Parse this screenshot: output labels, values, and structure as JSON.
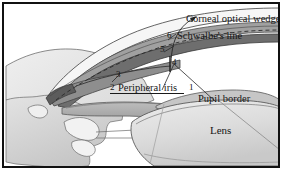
{
  "figure": {
    "kind": "anatomical-diagram",
    "border_color": "#111111",
    "background_color": "#ffffff"
  },
  "labels": {
    "corneal_optical_wedge": "Corneal optical wedge",
    "schwalbes_line": "Schwalbe's line",
    "peripheral_iris": "Peripheral iris",
    "pupil_border": "Pupil border",
    "lens": "Lens"
  },
  "callout_numbers": {
    "one": "1",
    "two": "2",
    "three": "3",
    "four": "4",
    "five": "5",
    "six": "6"
  },
  "palette": {
    "ink": "#161616",
    "line": "#3a3a3a",
    "cornea_fill": "#f2f2f2",
    "sclera_fill": "#e4e4e4",
    "band_mid_gray": "#9a9a9a",
    "band_dark_gray": "#6f6f6f",
    "iris_gray": "#a8a8a8",
    "lens_light": "#e8e8e8",
    "lens_shade": "#d2d2d2",
    "ciliary_gray": "#c9c9c9"
  }
}
